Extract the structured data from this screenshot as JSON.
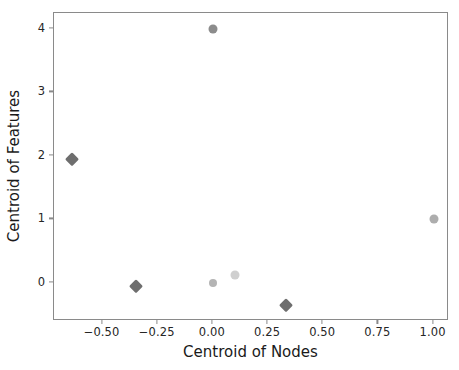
{
  "chart_data": {
    "type": "scatter",
    "title": "",
    "xlabel": "Centroid of Nodes",
    "ylabel": "Centroid of Features",
    "xlim": [
      -0.72,
      1.07
    ],
    "ylim": [
      -0.6,
      4.25
    ],
    "grid": false,
    "legend": null,
    "xticks": [
      -0.5,
      -0.25,
      0.0,
      0.25,
      0.5,
      0.75,
      1.0
    ],
    "xticklabels": [
      "−0.50",
      "−0.25",
      "0.00",
      "0.25",
      "0.50",
      "0.75",
      "1.00"
    ],
    "yticks": [
      0,
      1,
      2,
      3,
      4
    ],
    "yticklabels": [
      "0",
      "1",
      "2",
      "3",
      "4"
    ],
    "points": [
      {
        "name": "point-diamond-left",
        "x": -0.64,
        "y": 1.95,
        "marker": "diamond",
        "size": 13,
        "color": "#6e6e6e"
      },
      {
        "name": "point-diamond-lower-left",
        "x": -0.35,
        "y": -0.05,
        "marker": "diamond",
        "size": 13,
        "color": "#6e6e6e"
      },
      {
        "name": "point-diamond-bottom",
        "x": 0.33,
        "y": -0.35,
        "marker": "diamond",
        "size": 13,
        "color": "#6e6e6e"
      },
      {
        "name": "point-circle-top",
        "x": 0.0,
        "y": 4.0,
        "marker": "circle",
        "size": 9,
        "color": "#8c8c8c"
      },
      {
        "name": "point-circle-origin",
        "x": 0.0,
        "y": 0.0,
        "marker": "circle",
        "size": 8,
        "color": "#b4b4b4"
      },
      {
        "name": "point-circle-near-origin",
        "x": 0.1,
        "y": 0.12,
        "marker": "circle",
        "size": 9,
        "color": "#cfcfcf"
      },
      {
        "name": "point-circle-right",
        "x": 1.0,
        "y": 1.0,
        "marker": "circle",
        "size": 9,
        "color": "#adadad"
      }
    ],
    "axis_color": "#8a8a8a",
    "text_color": "#262626",
    "background": "#ffffff"
  }
}
